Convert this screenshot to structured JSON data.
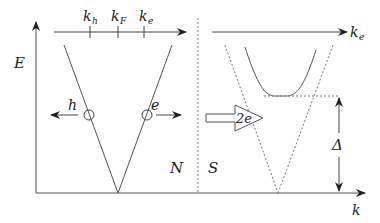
{
  "diagram": {
    "axes": {
      "energy_label": "E",
      "momentum_label": "k",
      "top_axis_normal": {
        "ticks": [
          {
            "label": "k",
            "subscript": "h"
          },
          {
            "label": "k",
            "subscript": "F"
          },
          {
            "label": "k",
            "subscript": "e"
          }
        ]
      },
      "top_axis_super": {
        "label": "k",
        "subscript": "e"
      }
    },
    "regions": {
      "normal": "N",
      "superconductor": "S"
    },
    "particles": {
      "hole": "h",
      "electron": "e"
    },
    "cooper_pair_arrow": "2e",
    "gap_label": "Δ",
    "colors": {
      "line": "#555555",
      "dotted": "#777777",
      "background": "#ffffff"
    }
  }
}
